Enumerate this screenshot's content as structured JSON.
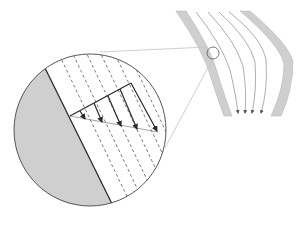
{
  "diagram": {
    "type": "fluid-flow-velocity-profile",
    "colors": {
      "background": "#ffffff",
      "wall_fill": "#cfcfcf",
      "wall_stroke": "#9a9a9a",
      "line": "#2a2a2a",
      "streamline": "#8a8a8a",
      "leader": "#bdbdbd",
      "inset_fill": "#cfcfcf"
    },
    "channel": {
      "streamline_count": 4,
      "arrowheads": 4
    },
    "inset": {
      "profile_arrows": 5,
      "dashed_lines": 7
    }
  }
}
